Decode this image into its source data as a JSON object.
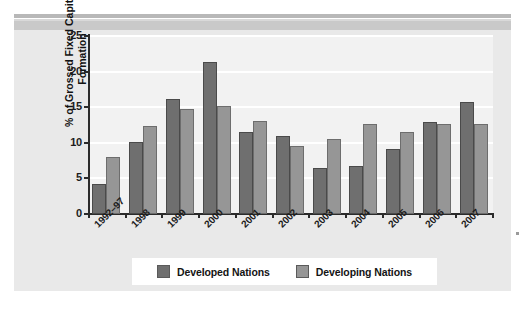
{
  "chart_data": {
    "type": "bar",
    "title": "",
    "subtitle": "",
    "xlabel": "",
    "ylabel": "% of Grossed Fixed Capital Formation",
    "ylabel_lines": [
      "% of Grossed Fixed Capital",
      "Formation"
    ],
    "ylim": [
      0,
      25
    ],
    "yticks": [
      0,
      5,
      10,
      15,
      20,
      25
    ],
    "ytick_labels": [
      "0",
      "5",
      "10",
      "15",
      "20",
      "25"
    ],
    "grid": true,
    "grid_axis": "y",
    "legend_position": "bottom",
    "categories": [
      "1992–97",
      "1998",
      "1999",
      "2000",
      "2001",
      "2002",
      "2003",
      "2004",
      "2005",
      "2006",
      "2007"
    ],
    "series": [
      {
        "name": "Developed Nations",
        "color": "#6f6f6f",
        "values": [
          4.2,
          10.1,
          16.1,
          21.3,
          11.5,
          11.0,
          6.5,
          6.7,
          9.1,
          12.9,
          15.7
        ]
      },
      {
        "name": "Developing Nations",
        "color": "#969696",
        "values": [
          8.0,
          12.3,
          14.7,
          15.1,
          13.1,
          9.6,
          10.6,
          12.6,
          11.5,
          12.6,
          12.7
        ]
      }
    ]
  },
  "legend": {
    "entries": [
      {
        "label": "Developed Nations",
        "swatch": "developed"
      },
      {
        "label": "Developing Nations",
        "swatch": "developing"
      }
    ]
  },
  "colors": {
    "developed": "#6f6f6f",
    "developing": "#969696",
    "panel_background": "#e9e9e9",
    "plot_background": "#f2f2f2",
    "axis": "#2b2b2b",
    "gridline": "#ffffff"
  }
}
